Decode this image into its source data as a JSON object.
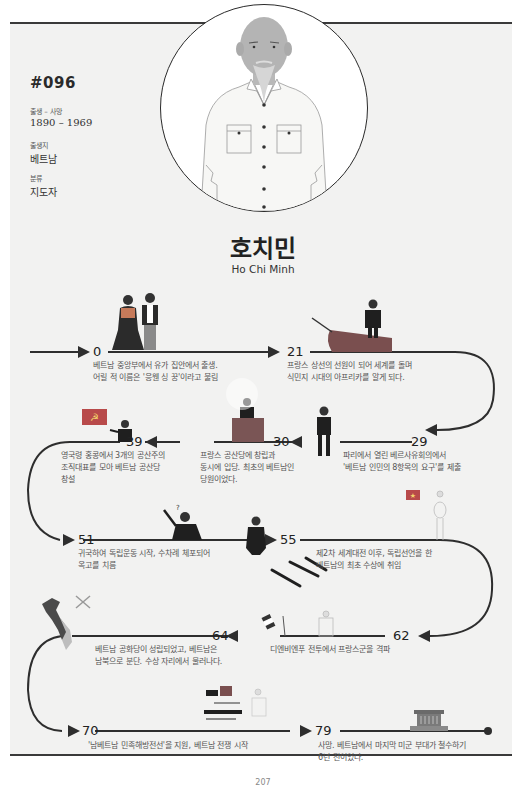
{
  "profile": {
    "id": "#096",
    "birth_death_label": "출생 – 사망",
    "birth_death_value": "1890 – 1969",
    "birthplace_label": "출생지",
    "birthplace_value": "베트남",
    "category_label": "분류",
    "category_value": "지도자",
    "name_ko": "호치민",
    "name_en": "Ho Chi Minh"
  },
  "timeline": [
    {
      "age": "0",
      "lines": [
        "베트남 중앙부에서 유가 집안에서 출생.",
        "어릴 적 이름은 '응웬 싱 꿍'이라고 불림"
      ]
    },
    {
      "age": "21",
      "lines": [
        "프랑스 상선의 선원이 되어 세계를 돌며",
        "식민지 시대의 아프리카를 알게 되다."
      ]
    },
    {
      "age": "29",
      "lines": [
        "파리에서 열린 베르사유회의에서",
        "'베트남 인민의 8항목의 요구'를 제출"
      ]
    },
    {
      "age": "30",
      "lines": [
        "프랑스 공산당에 창립과",
        "동시에 입당. 최초의 베트남인",
        "당원이었다."
      ]
    },
    {
      "age": "39",
      "lines": [
        "영국령 홍콩에서 3개의 공산주의",
        "조직대표를 모아 베트남 공산당",
        "창설"
      ]
    },
    {
      "age": "51",
      "lines": [
        "귀국하여 독립운동 시작, 수차례 체포되어",
        "옥고를 치름"
      ]
    },
    {
      "age": "55",
      "lines": [
        "제2차 세계대전 이후, 독립선언을 한",
        "베트남의 최초 수상에 취임"
      ]
    },
    {
      "age": "62",
      "lines": [
        "디엔비엔푸 전투에서 프랑스군을 격파"
      ]
    },
    {
      "age": "64",
      "lines": [
        "베트남 공화당이 성립되었고, 베트남은",
        "남북으로 분단. 수상 자리에서 물러나다."
      ]
    },
    {
      "age": "70",
      "lines": [
        "'남베트남 민족해방전선'을 지원, 베트남 전쟁 시작"
      ]
    },
    {
      "age": "79",
      "lines": [
        "사망. 베트남에서 마지막 미군 부대가 철수하기",
        "6년 전이었다."
      ]
    }
  ],
  "colors": {
    "page_bg": "#f2f2f1",
    "track": "#2e2e2e",
    "flag_red": "#b84a4a",
    "podium": "#7a5555",
    "boat": "#7a4f4f"
  },
  "footer": {
    "page_number": "207"
  }
}
